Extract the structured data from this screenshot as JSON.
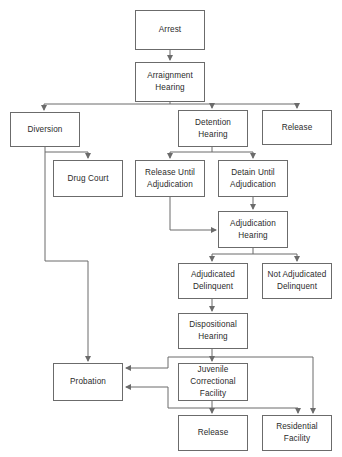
{
  "diagram": {
    "type": "flowchart",
    "width": 342,
    "height": 457,
    "background_color": "#ffffff",
    "box_border_color": "#6b6b6b",
    "edge_color": "#6b6b6b",
    "text_color": "#2b2b2b",
    "nodes": [
      {
        "id": "arrest",
        "label": "Arrest",
        "x": 135,
        "y": 10,
        "w": 70,
        "h": 40
      },
      {
        "id": "arraignment",
        "label": "Arraignment\nHearing",
        "x": 135,
        "y": 62,
        "w": 70,
        "h": 40
      },
      {
        "id": "diversion",
        "label": "Diversion",
        "x": 10,
        "y": 112,
        "w": 70,
        "h": 35
      },
      {
        "id": "detention",
        "label": "Detention\nHearing",
        "x": 178,
        "y": 110,
        "w": 70,
        "h": 37
      },
      {
        "id": "release_top",
        "label": "Release",
        "x": 262,
        "y": 110,
        "w": 70,
        "h": 35
      },
      {
        "id": "drug_court",
        "label": "Drug Court",
        "x": 53,
        "y": 160,
        "w": 70,
        "h": 37
      },
      {
        "id": "release_until",
        "label": "Release Until\nAdjudication",
        "x": 135,
        "y": 160,
        "w": 70,
        "h": 37
      },
      {
        "id": "detain_until",
        "label": "Detain Until\nAdjudication",
        "x": 218,
        "y": 160,
        "w": 70,
        "h": 37
      },
      {
        "id": "adjudication",
        "label": "Adjudication\nHearing",
        "x": 218,
        "y": 211,
        "w": 70,
        "h": 37
      },
      {
        "id": "adjudicated",
        "label": "Adjudicated\nDelinquent",
        "x": 178,
        "y": 263,
        "w": 70,
        "h": 36
      },
      {
        "id": "not_adjudicated",
        "label": "Not Adjudicated\nDelinquent",
        "x": 262,
        "y": 263,
        "w": 70,
        "h": 36
      },
      {
        "id": "dispositional",
        "label": "Dispositional\nHearing",
        "x": 178,
        "y": 313,
        "w": 70,
        "h": 36
      },
      {
        "id": "probation",
        "label": "Probation",
        "x": 53,
        "y": 363,
        "w": 70,
        "h": 38
      },
      {
        "id": "juvenile_corr",
        "label": "Juvenile\nCorrectional\nFacility",
        "x": 178,
        "y": 363,
        "w": 70,
        "h": 38
      },
      {
        "id": "release_bottom",
        "label": "Release",
        "x": 178,
        "y": 415,
        "w": 70,
        "h": 36
      },
      {
        "id": "residential",
        "label": "Residential\nFacility",
        "x": 262,
        "y": 415,
        "w": 70,
        "h": 36
      }
    ],
    "edges": [
      {
        "from": "arrest",
        "to": "arraignment",
        "path": "M170,50 L170,60",
        "arrow": "down"
      },
      {
        "from": "arraignment",
        "to": "bus",
        "path": "M170,102 L170,104",
        "arrow": "none"
      },
      {
        "from": "bus",
        "to": "bus",
        "path": "M44,104 L297,104",
        "arrow": "none"
      },
      {
        "from": "bus",
        "to": "diversion",
        "path": "M44,104 L44,110",
        "arrow": "down"
      },
      {
        "from": "bus",
        "to": "detention",
        "path": "M212,104 L212,108",
        "arrow": "down"
      },
      {
        "from": "bus",
        "to": "release_top",
        "path": "M297,104 L297,108",
        "arrow": "down"
      },
      {
        "from": "diversion",
        "to": "drug_court",
        "path": "M45,147 L45,152 L88,152 L88,158",
        "arrow": "down"
      },
      {
        "from": "diversion",
        "to": "probation",
        "path": "M45,152 L45,261 L88,261 L88,361",
        "arrow": "down"
      },
      {
        "from": "detention",
        "to": "bus2",
        "path": "M212,147 L212,152",
        "arrow": "none"
      },
      {
        "from": "bus2",
        "to": "bus2",
        "path": "M170,152 L253,152",
        "arrow": "none"
      },
      {
        "from": "bus2",
        "to": "release_until",
        "path": "M170,152 L170,158",
        "arrow": "down"
      },
      {
        "from": "bus2",
        "to": "detain_until",
        "path": "M253,152 L253,158",
        "arrow": "down"
      },
      {
        "from": "detain_until",
        "to": "adjudication",
        "path": "M253,197 L253,209",
        "arrow": "down"
      },
      {
        "from": "release_until",
        "to": "adjudication",
        "path": "M170,197 L170,230 L216,230",
        "arrow": "right"
      },
      {
        "from": "adjudication",
        "to": "bus3",
        "path": "M253,248 L253,254",
        "arrow": "none"
      },
      {
        "from": "bus3",
        "to": "bus3",
        "path": "M212,254 L297,254",
        "arrow": "none"
      },
      {
        "from": "bus3",
        "to": "adjudicated",
        "path": "M212,254 L212,261",
        "arrow": "down"
      },
      {
        "from": "bus3",
        "to": "not_adjudicated",
        "path": "M297,254 L297,261",
        "arrow": "down"
      },
      {
        "from": "adjudicated",
        "to": "dispositional",
        "path": "M212,299 L212,311",
        "arrow": "down"
      },
      {
        "from": "dispositional",
        "to": "juvenile_corr",
        "path": "M212,349 L212,361",
        "arrow": "down"
      },
      {
        "from": "dispositional",
        "to": "probation",
        "path": "M168,357 L168,368 L126,368",
        "arrow": "left"
      },
      {
        "from": "juvenile_corr",
        "to": "probation",
        "path": "M168,387 L126,387",
        "arrow": "left"
      },
      {
        "from": "juvenile_corr",
        "to": "release_bottom",
        "path": "M212,401 L212,413",
        "arrow": "down"
      },
      {
        "from": "juvenile_corr",
        "to": "residential",
        "path": "M168,387 L168,408 L298,408 L298,413",
        "arrow": "down"
      },
      {
        "from": "dispositional",
        "to": "residential",
        "path": "M168,357 L313,357 L313,413",
        "arrow": "down"
      }
    ]
  }
}
